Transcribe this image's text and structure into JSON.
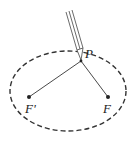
{
  "diagram": {
    "labels": {
      "point": "P",
      "focus_left": "F'",
      "focus_right": "F"
    },
    "colors": {
      "stroke": "#333333",
      "background": "#ffffff"
    },
    "ellipse": {
      "cx": 68,
      "cy": 91,
      "rx": 58,
      "ry": 40,
      "style": "dashed"
    },
    "points": {
      "P": [
        81,
        61
      ],
      "F_prime": [
        29,
        97
      ],
      "F": [
        108,
        97
      ]
    }
  }
}
